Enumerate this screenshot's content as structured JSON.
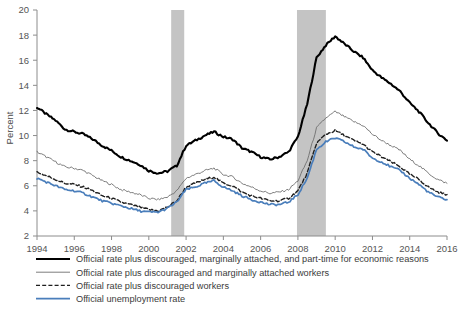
{
  "chart_data": {
    "type": "line",
    "title": "",
    "xlabel": "",
    "ylabel": "Percent",
    "ylim": [
      2,
      20
    ],
    "xlim": [
      1994,
      2016
    ],
    "ytick_step": 2,
    "yticks": [
      2,
      4,
      6,
      8,
      10,
      12,
      14,
      16,
      18,
      20
    ],
    "xticks": [
      1994,
      1996,
      1998,
      2000,
      2002,
      2004,
      2006,
      2008,
      2010,
      2012,
      2014,
      2016
    ],
    "grid": false,
    "legend_position": "below",
    "shaded_regions": [
      {
        "label": "2001 recession",
        "start": 2001.2,
        "end": 2001.9,
        "color": "#c4c4c4"
      },
      {
        "label": "2008 recession",
        "start": 2007.95,
        "end": 2009.5,
        "color": "#c4c4c4"
      }
    ],
    "x": [
      1994.0,
      1994.5,
      1995.0,
      1995.5,
      1996.0,
      1996.5,
      1997.0,
      1997.5,
      1998.0,
      1998.5,
      1999.0,
      1999.5,
      2000.0,
      2000.5,
      2001.0,
      2001.5,
      2002.0,
      2002.5,
      2003.0,
      2003.5,
      2004.0,
      2004.5,
      2005.0,
      2005.5,
      2006.0,
      2006.5,
      2007.0,
      2007.5,
      2008.0,
      2008.5,
      2009.0,
      2009.5,
      2010.0,
      2010.5,
      2011.0,
      2011.5,
      2012.0,
      2012.5,
      2013.0,
      2013.5,
      2014.0,
      2014.5,
      2015.0,
      2015.5,
      2016.0
    ],
    "series": [
      {
        "name": "Official rate plus discouraged, marginally attached, and part-time for economic reasons",
        "key": "u6",
        "color": "#000000",
        "width": 2.1,
        "dash": "none",
        "values": [
          12.25,
          11.7,
          11.2,
          10.5,
          10.3,
          10.1,
          9.7,
          9.2,
          8.8,
          8.3,
          8.0,
          7.7,
          7.2,
          7.0,
          7.15,
          7.6,
          9.2,
          9.6,
          10.0,
          10.3,
          9.9,
          9.7,
          9.0,
          8.7,
          8.3,
          8.1,
          8.3,
          8.7,
          9.9,
          12.5,
          16.2,
          17.2,
          17.9,
          17.3,
          16.7,
          16.2,
          15.2,
          14.6,
          14.1,
          13.5,
          12.6,
          11.9,
          11.0,
          10.2,
          9.6
        ]
      },
      {
        "name": "Official rate plus discouraged and marginally attached workers",
        "key": "u5",
        "color": "#6e6e6e",
        "width": 0.9,
        "dash": "none",
        "values": [
          8.7,
          8.3,
          7.9,
          7.5,
          7.4,
          7.2,
          6.8,
          6.4,
          6.1,
          5.7,
          5.5,
          5.3,
          5.0,
          4.9,
          5.1,
          5.6,
          6.6,
          6.9,
          7.2,
          7.4,
          6.9,
          6.7,
          6.2,
          5.9,
          5.6,
          5.4,
          5.5,
          5.7,
          6.4,
          8.0,
          10.6,
          11.4,
          11.9,
          11.5,
          11.1,
          10.8,
          10.1,
          9.6,
          9.2,
          8.8,
          8.1,
          7.6,
          7.0,
          6.5,
          6.2
        ]
      },
      {
        "name": "Official rate plus discouraged workers",
        "key": "u4",
        "color": "#1f1f1f",
        "width": 1.4,
        "dash": "dashed",
        "values": [
          7.1,
          6.8,
          6.5,
          6.2,
          6.1,
          5.9,
          5.6,
          5.2,
          5.0,
          4.7,
          4.5,
          4.3,
          4.1,
          4.0,
          4.3,
          4.8,
          5.9,
          6.2,
          6.5,
          6.7,
          6.2,
          6.0,
          5.5,
          5.2,
          5.0,
          4.8,
          4.8,
          5.0,
          5.6,
          7.0,
          9.4,
          10.1,
          10.4,
          10.0,
          9.6,
          9.3,
          8.7,
          8.3,
          7.9,
          7.5,
          6.9,
          6.5,
          5.9,
          5.5,
          5.3
        ]
      },
      {
        "name": "Official unemployment rate",
        "key": "u3",
        "color": "#4a7ebb",
        "width": 1.7,
        "dash": "none",
        "values": [
          6.6,
          6.3,
          6.0,
          5.7,
          5.6,
          5.4,
          5.1,
          4.8,
          4.6,
          4.4,
          4.2,
          4.0,
          3.9,
          3.9,
          4.2,
          4.7,
          5.7,
          5.9,
          6.2,
          6.4,
          5.9,
          5.6,
          5.2,
          4.9,
          4.7,
          4.5,
          4.5,
          4.7,
          5.3,
          6.6,
          8.9,
          9.5,
          9.8,
          9.5,
          9.1,
          8.9,
          8.2,
          7.9,
          7.5,
          7.2,
          6.6,
          6.1,
          5.5,
          5.1,
          4.9
        ]
      }
    ]
  },
  "legend": {
    "items": [
      {
        "label": "Official rate plus discouraged, marginally attached, and part-time for economic reasons",
        "swatch": "solid-thick-black"
      },
      {
        "label": "Official rate plus discouraged and marginally attached workers",
        "swatch": "solid-thin-gray"
      },
      {
        "label": "Official rate plus discouraged workers",
        "swatch": "dashed-black"
      },
      {
        "label": "Official unemployment rate",
        "swatch": "solid-blue"
      }
    ]
  },
  "axes": {
    "y_title": "Percent"
  }
}
